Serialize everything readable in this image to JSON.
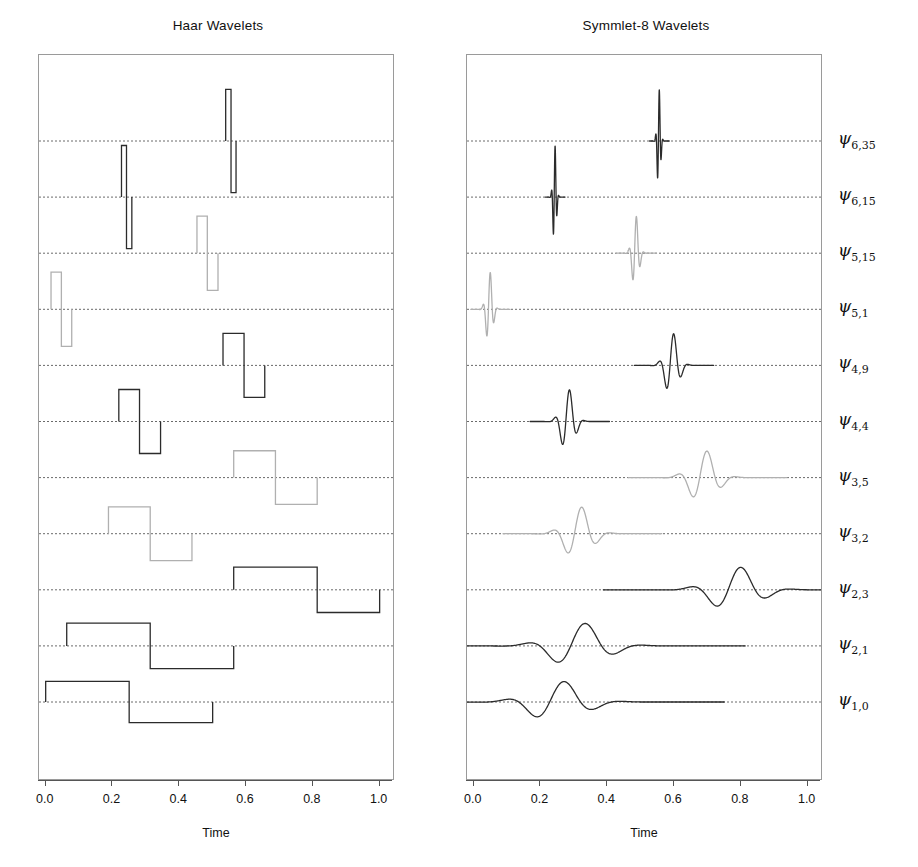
{
  "figure": {
    "panels": [
      {
        "id": "haar",
        "title": "Haar Wavelets",
        "xlabel": "Time"
      },
      {
        "id": "symmlet",
        "title": "Symmlet-8 Wavelets",
        "xlabel": "Time"
      }
    ],
    "xticks": [
      "0.0",
      "0.2",
      "0.4",
      "0.6",
      "0.8",
      "1.0"
    ],
    "xtickvals": [
      0.0,
      0.2,
      0.4,
      0.6,
      0.8,
      1.0
    ],
    "xlim": [
      -0.02,
      1.04
    ],
    "row_labels": [
      {
        "psi": "ψ",
        "sub": "6,35"
      },
      {
        "psi": "ψ",
        "sub": "6,15"
      },
      {
        "psi": "ψ",
        "sub": "5,15"
      },
      {
        "psi": "ψ",
        "sub": "5,1"
      },
      {
        "psi": "ψ",
        "sub": "4,9"
      },
      {
        "psi": "ψ",
        "sub": "4,4"
      },
      {
        "psi": "ψ",
        "sub": "3,5"
      },
      {
        "psi": "ψ",
        "sub": "3,2"
      },
      {
        "psi": "ψ",
        "sub": "2,3"
      },
      {
        "psi": "ψ",
        "sub": "2,1"
      },
      {
        "psi": "ψ",
        "sub": "1,0"
      }
    ],
    "colors": {
      "dark": "#2b2b2b",
      "mid": "#6e6e6e",
      "light": "#b0b0b0",
      "box": "#9a9a9a",
      "baseline": "#6a6a6a"
    }
  },
  "chart_data": {
    "type": "line",
    "xlabel": "Time",
    "ylabel": "",
    "xlim": [
      -0.02,
      1.04
    ],
    "grid": "horizontal-dotted-baselines",
    "legend": "right-side row labels",
    "rows": [
      {
        "label": "psi_6,35",
        "j": 6,
        "k": 35,
        "center": 0.555,
        "support": [
          0.539,
          0.57
        ],
        "shade": "dark",
        "amplitude": 1.0
      },
      {
        "label": "psi_6,15",
        "j": 6,
        "k": 15,
        "center": 0.242,
        "support": [
          0.227,
          0.258
        ],
        "shade": "dark",
        "amplitude": 1.0
      },
      {
        "label": "psi_5,15",
        "j": 5,
        "k": 15,
        "center": 0.484,
        "support": [
          0.453,
          0.516
        ],
        "shade": "light",
        "amplitude": 0.72
      },
      {
        "label": "psi_5,1",
        "j": 5,
        "k": 1,
        "center": 0.047,
        "support": [
          0.016,
          0.078
        ],
        "shade": "light",
        "amplitude": 0.72
      },
      {
        "label": "psi_4,9",
        "j": 4,
        "k": 9,
        "center": 0.594,
        "support": [
          0.531,
          0.656
        ],
        "shade": "dark",
        "amplitude": 0.62
      },
      {
        "label": "psi_4,4",
        "j": 4,
        "k": 4,
        "center": 0.281,
        "support": [
          0.219,
          0.344
        ],
        "shade": "dark",
        "amplitude": 0.62
      },
      {
        "label": "psi_3,5",
        "j": 3,
        "k": 5,
        "center": 0.688,
        "support": [
          0.563,
          0.813
        ],
        "shade": "light",
        "amplitude": 0.52
      },
      {
        "label": "psi_3,2",
        "j": 3,
        "k": 2,
        "center": 0.313,
        "support": [
          0.188,
          0.438
        ],
        "shade": "light",
        "amplitude": 0.52
      },
      {
        "label": "psi_2,3",
        "j": 2,
        "k": 3,
        "center": 0.813,
        "support": [
          0.563,
          1.0
        ],
        "shade": "dark",
        "amplitude": 0.44
      },
      {
        "label": "psi_2,1",
        "j": 2,
        "k": 1,
        "center": 0.313,
        "support": [
          0.063,
          0.563
        ],
        "shade": "dark",
        "amplitude": 0.44
      },
      {
        "label": "psi_1,0",
        "j": 1,
        "k": 0,
        "center": 0.25,
        "support": [
          0.0,
          0.5
        ],
        "shade": "dark",
        "amplitude": 0.4
      }
    ],
    "haar_description": "Square-wave (Haar) basis functions, one per row, offset vertically at dotted baselines; each is a positive box followed by a negative box of equal width.",
    "symmlet_description": "Symmlet-8 (sym8) mother-wavelet translates/dilations, smooth oscillatory bumps centered at the same time locations as the Haar counterparts."
  }
}
